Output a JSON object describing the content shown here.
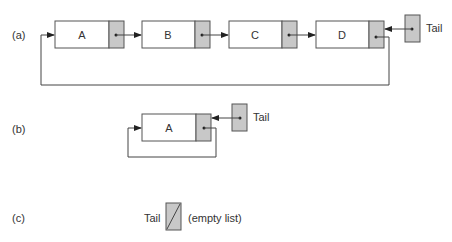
{
  "diagram": {
    "colors": {
      "pointer_field": "#c8c8c8",
      "line": "#444444",
      "node_fill": "#ffffff"
    },
    "parts": [
      {
        "label": "(a)",
        "nodes": [
          "A",
          "B",
          "C",
          "D"
        ],
        "tail_label": "Tail",
        "circular": true
      },
      {
        "label": "(b)",
        "nodes": [
          "A"
        ],
        "tail_label": "Tail",
        "circular": true
      },
      {
        "label": "(c)",
        "nodes": [],
        "tail_label": "Tail",
        "tail_null": true,
        "note": "(empty list)"
      }
    ]
  }
}
